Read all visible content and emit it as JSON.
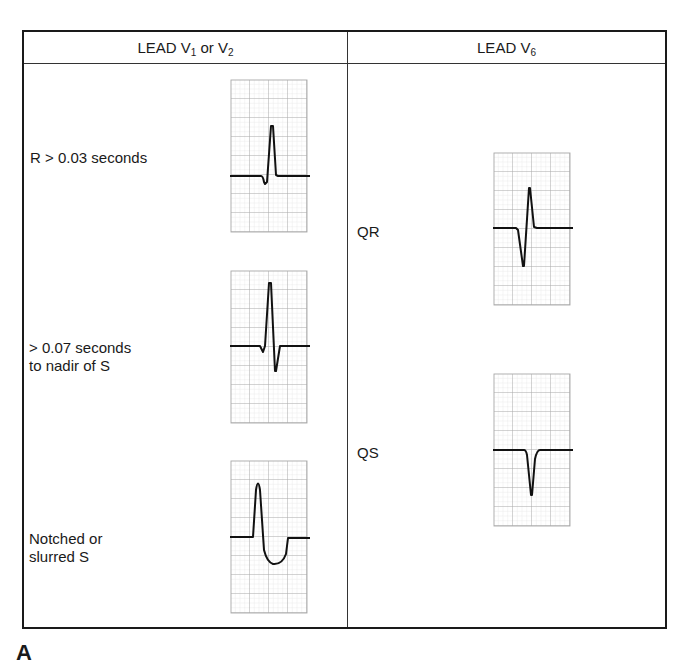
{
  "figure": {
    "panel_letter": "A",
    "columns": [
      {
        "header": {
          "prefix": "LEAD V",
          "sub1": "1",
          "middle": " or V",
          "sub2": "2"
        },
        "rows": [
          {
            "label_lines": [
              "R > 0.03 seconds"
            ],
            "waveform": "rsr-wide-r"
          },
          {
            "label_lines": [
              "> 0.07 seconds",
              "to nadir of S"
            ],
            "waveform": "rs-deep-s"
          },
          {
            "label_lines": [
              "Notched or",
              "slurred S"
            ],
            "waveform": "r-slurred-s"
          }
        ]
      },
      {
        "header": {
          "prefix": "LEAD V",
          "sub1": "6",
          "middle": "",
          "sub2": ""
        },
        "rows": [
          {
            "label_lines": [
              "QR"
            ],
            "waveform": "qr-complex"
          },
          {
            "label_lines": [
              "QS"
            ],
            "waveform": "qs-complex"
          }
        ]
      }
    ],
    "colors": {
      "border": "#1a1a1a",
      "grid_major": "#a8a8a8",
      "grid_minor": "#d6d6d6",
      "trace": "#111111"
    }
  }
}
